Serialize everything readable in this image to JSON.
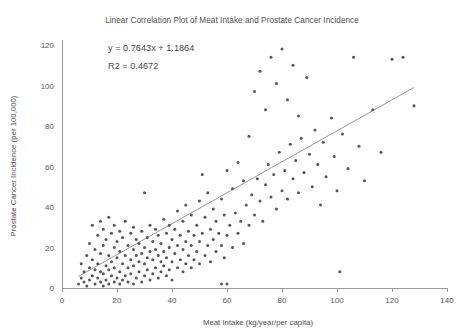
{
  "chart_data": {
    "type": "scatter",
    "title": "Linear Correlation Plot of Meat Intake and Prostate Cancer Incidence",
    "xlabel": "Meat Intake (kg/year/per capita)",
    "ylabel": "Prostate Cancer Incidence (per 100,000)",
    "xlim": [
      0,
      140
    ],
    "ylim": [
      0,
      120
    ],
    "xticks": [
      0,
      20,
      40,
      60,
      80,
      100,
      120,
      140
    ],
    "yticks": [
      0,
      20,
      40,
      60,
      80,
      100,
      120
    ],
    "grid": false,
    "legend": false,
    "annotations": {
      "equation": "y = 0.7643x + 1.1864",
      "r_squared": "R2 = 0.4672"
    },
    "fit": {
      "slope": 0.7643,
      "intercept": 1.1864,
      "r2": 0.4672,
      "x_start": 6,
      "x_end": 128
    },
    "marker": {
      "color": "#565656",
      "size_px": 3.0,
      "shape": "circle"
    },
    "points": [
      [
        6,
        2
      ],
      [
        7,
        5
      ],
      [
        7,
        12
      ],
      [
        8,
        3
      ],
      [
        8,
        8
      ],
      [
        9,
        1
      ],
      [
        9,
        16
      ],
      [
        10,
        4
      ],
      [
        10,
        10
      ],
      [
        10,
        22
      ],
      [
        11,
        6
      ],
      [
        11,
        14
      ],
      [
        11,
        31
      ],
      [
        12,
        2
      ],
      [
        12,
        9
      ],
      [
        12,
        19
      ],
      [
        13,
        5
      ],
      [
        13,
        12
      ],
      [
        13,
        26
      ],
      [
        14,
        3
      ],
      [
        14,
        8
      ],
      [
        14,
        17
      ],
      [
        14,
        33
      ],
      [
        15,
        1
      ],
      [
        15,
        7
      ],
      [
        15,
        21
      ],
      [
        15,
        29
      ],
      [
        16,
        4
      ],
      [
        16,
        11
      ],
      [
        16,
        24
      ],
      [
        17,
        2
      ],
      [
        17,
        9
      ],
      [
        17,
        16
      ],
      [
        17,
        35
      ],
      [
        18,
        6
      ],
      [
        18,
        13
      ],
      [
        18,
        27
      ],
      [
        19,
        3
      ],
      [
        19,
        10
      ],
      [
        19,
        20
      ],
      [
        19,
        31
      ],
      [
        20,
        5
      ],
      [
        20,
        15
      ],
      [
        20,
        23
      ],
      [
        21,
        2
      ],
      [
        21,
        8
      ],
      [
        21,
        18
      ],
      [
        21,
        28
      ],
      [
        22,
        4
      ],
      [
        22,
        12
      ],
      [
        22,
        25
      ],
      [
        23,
        6
      ],
      [
        23,
        16
      ],
      [
        23,
        33
      ],
      [
        24,
        3
      ],
      [
        24,
        10
      ],
      [
        24,
        21
      ],
      [
        25,
        7
      ],
      [
        25,
        14
      ],
      [
        25,
        27
      ],
      [
        26,
        2
      ],
      [
        26,
        11
      ],
      [
        26,
        19
      ],
      [
        26,
        30
      ],
      [
        27,
        5
      ],
      [
        27,
        16
      ],
      [
        27,
        24
      ],
      [
        28,
        8
      ],
      [
        28,
        13
      ],
      [
        28,
        22
      ],
      [
        29,
        3
      ],
      [
        29,
        17
      ],
      [
        29,
        28
      ],
      [
        30,
        6
      ],
      [
        30,
        12
      ],
      [
        30,
        20
      ],
      [
        30,
        47
      ],
      [
        31,
        9
      ],
      [
        31,
        15
      ],
      [
        31,
        25
      ],
      [
        32,
        4
      ],
      [
        32,
        18
      ],
      [
        32,
        31
      ],
      [
        33,
        7
      ],
      [
        33,
        14
      ],
      [
        33,
        23
      ],
      [
        34,
        10
      ],
      [
        34,
        19
      ],
      [
        34,
        29
      ],
      [
        35,
        5
      ],
      [
        35,
        16
      ],
      [
        35,
        26
      ],
      [
        36,
        8
      ],
      [
        36,
        13
      ],
      [
        36,
        22
      ],
      [
        37,
        11
      ],
      [
        37,
        18
      ],
      [
        37,
        34
      ],
      [
        38,
        6
      ],
      [
        38,
        15
      ],
      [
        38,
        27
      ],
      [
        39,
        9
      ],
      [
        39,
        20
      ],
      [
        39,
        31
      ],
      [
        40,
        4
      ],
      [
        40,
        13
      ],
      [
        40,
        24
      ],
      [
        41,
        17
      ],
      [
        41,
        29
      ],
      [
        42,
        10
      ],
      [
        42,
        21
      ],
      [
        42,
        38
      ],
      [
        43,
        14
      ],
      [
        43,
        26
      ],
      [
        44,
        8
      ],
      [
        44,
        19
      ],
      [
        44,
        33
      ],
      [
        45,
        12
      ],
      [
        45,
        23
      ],
      [
        45,
        41
      ],
      [
        46,
        16
      ],
      [
        46,
        28
      ],
      [
        47,
        10
      ],
      [
        47,
        21
      ],
      [
        47,
        36
      ],
      [
        48,
        14
      ],
      [
        48,
        26
      ],
      [
        49,
        18
      ],
      [
        49,
        31
      ],
      [
        50,
        12
      ],
      [
        50,
        23
      ],
      [
        50,
        43
      ],
      [
        51,
        27
      ],
      [
        51,
        56
      ],
      [
        52,
        16
      ],
      [
        52,
        35
      ],
      [
        53,
        21
      ],
      [
        53,
        47
      ],
      [
        54,
        13
      ],
      [
        54,
        29
      ],
      [
        55,
        24
      ],
      [
        55,
        39
      ],
      [
        56,
        18
      ],
      [
        56,
        33
      ],
      [
        57,
        27
      ],
      [
        58,
        2
      ],
      [
        58,
        21
      ],
      [
        58,
        44
      ],
      [
        59,
        15
      ],
      [
        59,
        36
      ],
      [
        60,
        2
      ],
      [
        60,
        26
      ],
      [
        60,
        58
      ],
      [
        61,
        31
      ],
      [
        62,
        20
      ],
      [
        62,
        49
      ],
      [
        63,
        37
      ],
      [
        64,
        27
      ],
      [
        64,
        62
      ],
      [
        65,
        33
      ],
      [
        66,
        22
      ],
      [
        66,
        53
      ],
      [
        67,
        41
      ],
      [
        68,
        31
      ],
      [
        68,
        75
      ],
      [
        69,
        46
      ],
      [
        70,
        36
      ],
      [
        70,
        97
      ],
      [
        71,
        54
      ],
      [
        72,
        43
      ],
      [
        72,
        107
      ],
      [
        73,
        33
      ],
      [
        74,
        51
      ],
      [
        74,
        88
      ],
      [
        75,
        61
      ],
      [
        76,
        45
      ],
      [
        76,
        114
      ],
      [
        77,
        56
      ],
      [
        78,
        39
      ],
      [
        78,
        101
      ],
      [
        79,
        67
      ],
      [
        80,
        48
      ],
      [
        80,
        118
      ],
      [
        81,
        58
      ],
      [
        82,
        44
      ],
      [
        82,
        93
      ],
      [
        83,
        71
      ],
      [
        84,
        54
      ],
      [
        84,
        110
      ],
      [
        85,
        63
      ],
      [
        86,
        47
      ],
      [
        86,
        85
      ],
      [
        87,
        74
      ],
      [
        88,
        57
      ],
      [
        89,
        104
      ],
      [
        90,
        66
      ],
      [
        91,
        50
      ],
      [
        92,
        78
      ],
      [
        93,
        61
      ],
      [
        94,
        41
      ],
      [
        95,
        72
      ],
      [
        96,
        55
      ],
      [
        98,
        84
      ],
      [
        99,
        65
      ],
      [
        100,
        48
      ],
      [
        101,
        8
      ],
      [
        102,
        76
      ],
      [
        104,
        59
      ],
      [
        106,
        114
      ],
      [
        108,
        70
      ],
      [
        110,
        53
      ],
      [
        113,
        88
      ],
      [
        116,
        67
      ],
      [
        120,
        113
      ],
      [
        124,
        114
      ],
      [
        128,
        90
      ]
    ]
  }
}
